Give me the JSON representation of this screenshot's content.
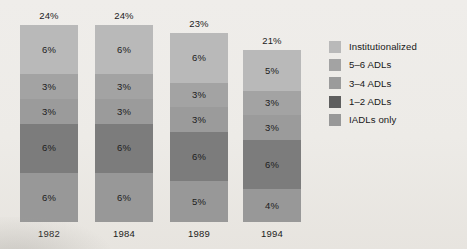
{
  "chart_data": {
    "type": "bar",
    "subtype": "stacked-vertical",
    "title": "",
    "xlabel": "",
    "ylabel": "",
    "categories": [
      "1982",
      "1984",
      "1989",
      "1994"
    ],
    "totals": [
      "24%",
      "24%",
      "23%",
      "21%"
    ],
    "total_values": [
      24,
      24,
      23,
      21
    ],
    "grid": false,
    "legend_position": "right",
    "stack_order_top_to_bottom": [
      "Institutionalized",
      "5–6 ADLs",
      "3–4 ADLs",
      "1–2 ADLs",
      "IADLs only"
    ],
    "series": [
      {
        "name": "Institutionalized",
        "color": "#b9b9b9",
        "values": [
          6,
          6,
          6,
          5
        ],
        "labels": [
          "6%",
          "6%",
          "6%",
          "5%"
        ]
      },
      {
        "name": "5–6 ADLs",
        "color": "#a3a3a3",
        "values": [
          3,
          3,
          3,
          3
        ],
        "labels": [
          "3%",
          "3%",
          "3%",
          "3%"
        ]
      },
      {
        "name": "3–4 ADLs",
        "color": "#9b9b9b",
        "values": [
          3,
          3,
          3,
          3
        ],
        "labels": [
          "3%",
          "3%",
          "3%",
          "3%"
        ]
      },
      {
        "name": "1–2 ADLs",
        "color": "#7c7c7c",
        "values": [
          6,
          6,
          6,
          6
        ],
        "labels": [
          "6%",
          "6%",
          "6%",
          "6%"
        ]
      },
      {
        "name": "IADLs only",
        "color": "#989898",
        "values": [
          6,
          6,
          5,
          4
        ],
        "labels": [
          "6%",
          "6%",
          "5%",
          "4%"
        ]
      }
    ]
  },
  "bars": [
    {
      "year": "1982",
      "total": "24%",
      "segments": [
        {
          "series": "Institutionalized",
          "label": "6%",
          "color": "#b9b9b9"
        },
        {
          "series": "5–6 ADLs",
          "label": "3%",
          "color": "#a3a3a3"
        },
        {
          "series": "3–4 ADLs",
          "label": "3%",
          "color": "#9b9b9b"
        },
        {
          "series": "1–2 ADLs",
          "label": "6%",
          "color": "#7c7c7c"
        },
        {
          "series": "IADLs only",
          "label": "6%",
          "color": "#989898"
        }
      ]
    },
    {
      "year": "1984",
      "total": "24%",
      "segments": [
        {
          "series": "Institutionalized",
          "label": "6%",
          "color": "#b9b9b9"
        },
        {
          "series": "5–6 ADLs",
          "label": "3%",
          "color": "#a3a3a3"
        },
        {
          "series": "3–4 ADLs",
          "label": "3%",
          "color": "#9b9b9b"
        },
        {
          "series": "1–2 ADLs",
          "label": "6%",
          "color": "#7c7c7c"
        },
        {
          "series": "IADLs only",
          "label": "6%",
          "color": "#989898"
        }
      ]
    },
    {
      "year": "1989",
      "total": "23%",
      "segments": [
        {
          "series": "Institutionalized",
          "label": "6%",
          "color": "#b9b9b9"
        },
        {
          "series": "5–6 ADLs",
          "label": "3%",
          "color": "#a3a3a3"
        },
        {
          "series": "3–4 ADLs",
          "label": "3%",
          "color": "#9b9b9b"
        },
        {
          "series": "1–2 ADLs",
          "label": "6%",
          "color": "#7c7c7c"
        },
        {
          "series": "IADLs only",
          "label": "5%",
          "color": "#989898"
        }
      ]
    },
    {
      "year": "1994",
      "total": "21%",
      "segments": [
        {
          "series": "Institutionalized",
          "label": "5%",
          "color": "#b9b9b9"
        },
        {
          "series": "5–6 ADLs",
          "label": "3%",
          "color": "#a3a3a3"
        },
        {
          "series": "3–4 ADLs",
          "label": "3%",
          "color": "#9b9b9b"
        },
        {
          "series": "1–2 ADLs",
          "label": "6%",
          "color": "#7c7c7c"
        },
        {
          "series": "IADLs only",
          "label": "4%",
          "color": "#989898"
        }
      ]
    }
  ],
  "legend": {
    "items": [
      {
        "label": "Institutionalized",
        "color": "#b9b9b9"
      },
      {
        "label": "5–6 ADLs",
        "color": "#a3a3a3"
      },
      {
        "label": "3–4 ADLs",
        "color": "#9b9b9b"
      },
      {
        "label": "1–2 ADLs",
        "color": "#5e5e5e"
      },
      {
        "label": "IADLs only",
        "color": "#989898"
      }
    ]
  }
}
